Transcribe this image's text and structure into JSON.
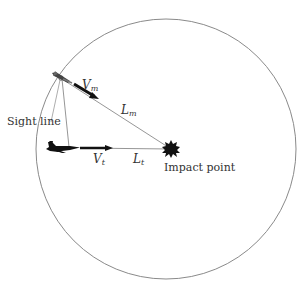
{
  "diagram": {
    "type": "intercept-geometry",
    "colors": {
      "circle": "#8a8a8a",
      "line": "#8a8a8a",
      "ink": "#111111",
      "text": "#333333"
    },
    "circle": {
      "cx": 166,
      "cy": 149,
      "r": 130
    },
    "labels": {
      "sight_line": "Sight line",
      "impact_point": "Impact point",
      "vm_main": "V",
      "vm_sub": "m",
      "lm_main": "L",
      "lm_sub": "m",
      "vt_main": "V",
      "vt_sub": "t",
      "lt_main": "L",
      "lt_sub": "t"
    },
    "elements": {
      "missile": "missile-icon",
      "target_aircraft": "fighter-jet-icon",
      "impact": "explosion-burst-icon"
    }
  }
}
